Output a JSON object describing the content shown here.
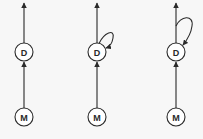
{
  "diagram": {
    "background": "#f7f7f7",
    "stroke_color": "#2a2a2a",
    "columns": [
      {
        "id": "graph-1",
        "x": 24,
        "nodes": [
          {
            "id": "D",
            "label": "D",
            "y": 52
          },
          {
            "id": "M",
            "label": "M",
            "y": 117
          }
        ],
        "edges": [
          {
            "from": "M",
            "to": "D"
          },
          {
            "from": "D",
            "to": "top"
          }
        ],
        "self_loop": "none"
      },
      {
        "id": "graph-2",
        "x": 97,
        "nodes": [
          {
            "id": "D",
            "label": "D",
            "y": 52
          },
          {
            "id": "M",
            "label": "M",
            "y": 117
          }
        ],
        "edges": [
          {
            "from": "M",
            "to": "D"
          },
          {
            "from": "D",
            "to": "top"
          },
          {
            "from": "D",
            "to": "D",
            "type": "self-loop"
          }
        ],
        "self_loop": "on-node"
      },
      {
        "id": "graph-3",
        "x": 176,
        "nodes": [
          {
            "id": "D",
            "label": "D",
            "y": 52
          },
          {
            "id": "M",
            "label": "M",
            "y": 117
          }
        ],
        "edges": [
          {
            "from": "M",
            "to": "D"
          },
          {
            "from": "D",
            "to": "top"
          },
          {
            "from": "D-output",
            "to": "D",
            "type": "feedback-loop"
          }
        ],
        "self_loop": "from-output"
      }
    ],
    "labels": {
      "c1_d": "D",
      "c1_m": "M",
      "c2_d": "D",
      "c2_m": "M",
      "c3_d": "D",
      "c3_m": "M"
    }
  }
}
